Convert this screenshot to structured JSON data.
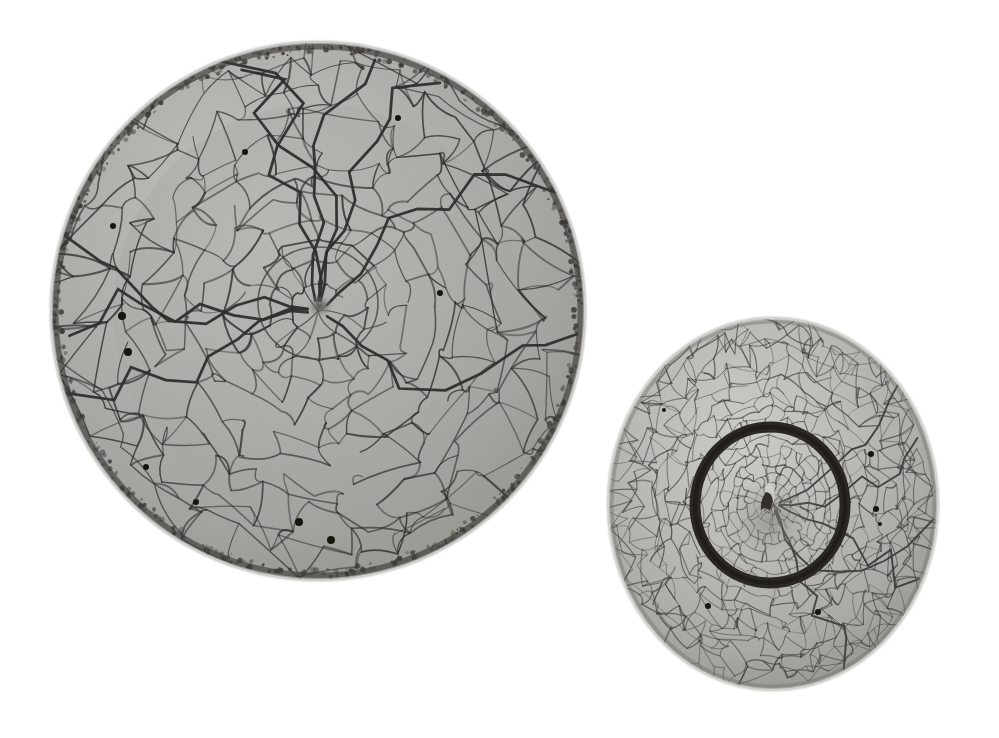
{
  "image": {
    "kind": "natural-photograph",
    "subject": "Two crackle-glazed ceramic vessels on a plain white background",
    "background_color": "#ffffff",
    "width": 999,
    "height": 738,
    "lighting": "soft diffuse studio light from upper left",
    "shadow": "none visible"
  },
  "objects": [
    {
      "id": "large-dish",
      "name": "Large crackle-glaze dish, interior view",
      "view": "from above, looking into the bowl",
      "center_x": 318,
      "center_y": 311,
      "radius_x": 267,
      "radius_y": 269,
      "glaze_color": "#a9a9a6",
      "glaze_color_light": "#bcbcb8",
      "glaze_color_shadow": "#8e8e8b",
      "crackle_color": "#2e2e2c",
      "rim_color": "#3a3936",
      "rim_note": "dark stippled brown-black rim where glaze thins over the body",
      "crackle_density": "coarse, large irregular polygonal cells radiating from centre",
      "center_well": {
        "radius": 60,
        "note": "shallow circular depression with a small dark pooled spot at the exact centre",
        "spot_color": "#5a5a57"
      },
      "iron_spots": [
        {
          "x": 122,
          "y": 316,
          "r": 4
        },
        {
          "x": 128,
          "y": 352,
          "r": 4
        },
        {
          "x": 113,
          "y": 226,
          "r": 3
        },
        {
          "x": 245,
          "y": 152,
          "r": 3
        },
        {
          "x": 146,
          "y": 467,
          "r": 3
        },
        {
          "x": 299,
          "y": 522,
          "r": 4
        },
        {
          "x": 331,
          "y": 540,
          "r": 4
        },
        {
          "x": 196,
          "y": 502,
          "r": 3
        },
        {
          "x": 398,
          "y": 118,
          "r": 3
        },
        {
          "x": 440,
          "y": 293,
          "r": 3
        }
      ]
    },
    {
      "id": "small-bowl",
      "name": "Small crackle-glaze bowl, underside view",
      "view": "from below, showing the unglazed foot ring",
      "center_x": 773,
      "center_y": 504,
      "radius_x": 165,
      "radius_y": 186,
      "glaze_color": "#b2b2ae",
      "glaze_color_light": "#c4c4c0",
      "glaze_color_shadow": "#97978f",
      "crackle_color": "#3b3b39",
      "crackle_density": "fine, dense net of small polygonal cells",
      "foot_ring": {
        "center_x": 770,
        "center_y": 505,
        "radius_x": 75,
        "radius_y": 78,
        "stroke_width": 11,
        "color": "#2a2724",
        "note": "unglazed dark-brown/iron-black foot rim"
      },
      "foot_center_mark": {
        "x": 770,
        "y": 498,
        "note": "small raised nipple / glaze scar at the centre of the base",
        "color": "#3a3734"
      },
      "iron_spots": [
        {
          "x": 871,
          "y": 454,
          "r": 3
        },
        {
          "x": 876,
          "y": 509,
          "r": 3
        },
        {
          "x": 880,
          "y": 524,
          "r": 2
        },
        {
          "x": 708,
          "y": 606,
          "r": 3
        },
        {
          "x": 818,
          "y": 612,
          "r": 3
        },
        {
          "x": 664,
          "y": 410,
          "r": 2
        }
      ]
    }
  ],
  "palette": {
    "background": "#ffffff",
    "glaze_mid": "#adadaa",
    "glaze_highlight": "#c8c8c4",
    "glaze_shadow": "#8b8b88",
    "crackle_line": "#2f2f2d",
    "foot_ring_dark": "#2a2724",
    "rim_dark": "#3a3936"
  }
}
